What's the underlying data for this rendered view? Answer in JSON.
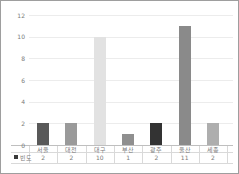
{
  "chart_data": {
    "type": "bar",
    "title": "",
    "categories": [
      "서울",
      "대전",
      "대구",
      "부산",
      "광주",
      "울산",
      "세종"
    ],
    "series": [
      {
        "name": "빈도",
        "values": [
          2,
          2,
          10,
          1,
          2,
          11,
          2
        ]
      }
    ],
    "xlabel": "",
    "ylabel": "",
    "ylim": [
      0,
      12
    ],
    "yticks": [
      0,
      2,
      4,
      6,
      8,
      10,
      12
    ],
    "grid": true,
    "legend_position": "data-table-left",
    "data_table_shown": true,
    "bar_colors": [
      "#595959",
      "#9a9a9a",
      "#e2e2e2",
      "#8f8f8f",
      "#333333",
      "#8a8a8a",
      "#aeaeae"
    ],
    "colors": {
      "gridline": "#ececec",
      "axis_line": "#bfbfbf",
      "table_line": "#d9d9d9",
      "text": "#7a7a7a",
      "legend_marker": "#3a3a3a",
      "frame_border": "#9e9e9e",
      "background": "#ffffff"
    }
  }
}
